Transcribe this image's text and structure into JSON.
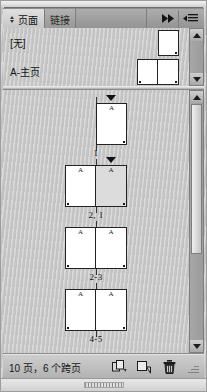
{
  "panel": {
    "title": "Pages panel",
    "tabs": [
      {
        "label": "页面",
        "active": true
      },
      {
        "label": "链接",
        "active": false
      }
    ],
    "collapse_icon": "double-chevron-right-icon",
    "menu_icon": "panel-menu-icon"
  },
  "masters": {
    "items": [
      {
        "label": "[无]",
        "pages": 1,
        "selected": false
      },
      {
        "label": "A-主页",
        "pages": 2,
        "selected": false
      }
    ]
  },
  "pages": {
    "spreads": [
      {
        "label": "1",
        "pages": [
          {
            "master": "A",
            "selected": false,
            "marker": true
          }
        ],
        "single": true,
        "side": "right"
      },
      {
        "label": "2, 1",
        "pages": [
          {
            "master": "A",
            "selected": false
          },
          {
            "master": "A",
            "selected": true
          }
        ],
        "single": false,
        "marker": true
      },
      {
        "label": "2-3",
        "pages": [
          {
            "master": "A",
            "selected": false
          },
          {
            "master": "A",
            "selected": false
          }
        ],
        "single": false,
        "marker": false
      },
      {
        "label": "4-5",
        "pages": [
          {
            "master": "A",
            "selected": false
          },
          {
            "master": "A",
            "selected": false
          }
        ],
        "single": false,
        "marker": false
      }
    ]
  },
  "footer": {
    "status": "10 页，6 个跨页",
    "buttons": [
      {
        "name": "new-spread-button",
        "icon": "duplicate-spread-icon"
      },
      {
        "name": "new-page-button",
        "icon": "new-page-icon"
      },
      {
        "name": "delete-page-button",
        "icon": "trash-icon"
      }
    ]
  },
  "colors": {
    "panel_bg": "#c9c9c9",
    "tab_active": "#d8d8d8",
    "tab_inactive": "#a2a2a2",
    "page_fill": "#ffffff",
    "page_selected": "#dcdcdc",
    "page_stroke": "#232323",
    "text": "#141414"
  }
}
